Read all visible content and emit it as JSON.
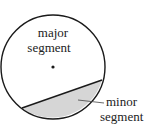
{
  "diagram": {
    "labels": {
      "major_line1": "major",
      "major_line2": "segment",
      "minor_line1": "minor",
      "minor_line2": "segment"
    },
    "colors": {
      "stroke": "#1a1a1a",
      "minor_fill": "#d6d6d6",
      "background": "#ffffff"
    },
    "circle": {
      "cx": 53,
      "cy": 67,
      "r": 52
    },
    "chord": {
      "x1": 22,
      "y1": 108,
      "x2": 102,
      "y2": 80
    },
    "center_dot": {
      "cx": 53,
      "cy": 67
    }
  }
}
